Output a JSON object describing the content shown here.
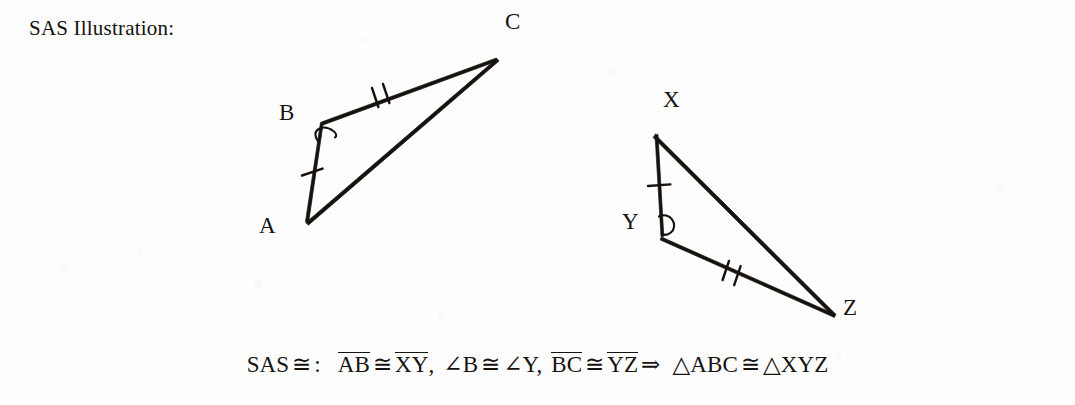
{
  "title": "SAS Illustration:",
  "canvas": {
    "width": 1075,
    "height": 405,
    "background": "#fdfdfd",
    "ink": "#15120f"
  },
  "figure": {
    "type": "geometry-diagram",
    "triangles": [
      {
        "name": "ABC",
        "vertices": [
          {
            "label": "A",
            "x": 305,
            "y": 222,
            "label_x": 259,
            "label_y": 214
          },
          {
            "label": "B",
            "x": 320,
            "y": 123,
            "label_x": 279,
            "label_y": 101
          },
          {
            "label": "C",
            "x": 497,
            "y": 58,
            "label_x": 505,
            "label_y": 10
          }
        ],
        "sides": [
          {
            "from": "A",
            "to": "B",
            "ticks": 1
          },
          {
            "from": "B",
            "to": "C",
            "ticks": 2
          },
          {
            "from": "A",
            "to": "C",
            "ticks": 0
          }
        ],
        "angle_marks": [
          {
            "at": "B",
            "style": "loop"
          }
        ]
      },
      {
        "name": "XYZ",
        "vertices": [
          {
            "label": "X",
            "x": 655,
            "y": 135,
            "label_x": 663,
            "label_y": 88
          },
          {
            "label": "Y",
            "x": 661,
            "y": 237,
            "label_x": 622,
            "label_y": 210
          },
          {
            "label": "Z",
            "x": 836,
            "y": 315,
            "label_x": 843,
            "label_y": 296
          }
        ],
        "sides": [
          {
            "from": "X",
            "to": "Y",
            "ticks": 1
          },
          {
            "from": "Y",
            "to": "Z",
            "ticks": 2
          },
          {
            "from": "X",
            "to": "Z",
            "ticks": 0
          }
        ],
        "angle_marks": [
          {
            "at": "Y",
            "style": "loop"
          }
        ]
      }
    ]
  },
  "formula": {
    "prefix": "SAS",
    "congruent": "≅",
    "colon": ":",
    "seg_ab": "AB",
    "seg_xy": "XY",
    "angle_b": "∠B",
    "angle_y": "∠Y",
    "seg_bc": "BC",
    "seg_yz": "YZ",
    "implies": "⇒",
    "tri_abc": "△ABC",
    "tri_xyz": "△XYZ",
    "comma": ",",
    "plain_text": "SAS ≅ :  AB ≅ XY, ∠B ≅ ∠Y, BC ≅ YZ ⇒ △ABC ≅ △XYZ"
  }
}
